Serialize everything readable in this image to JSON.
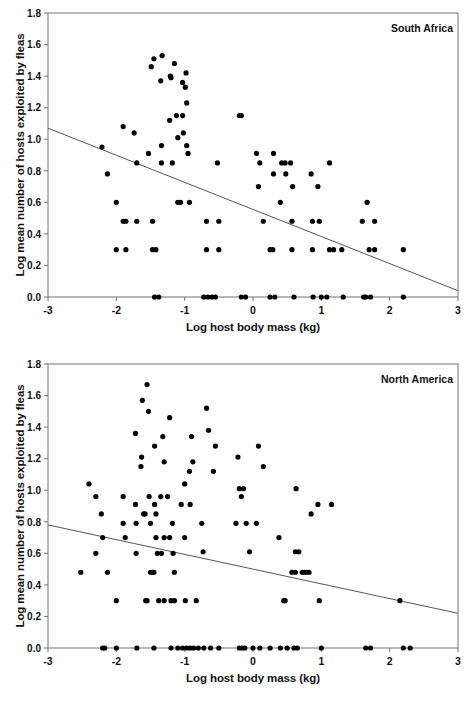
{
  "figure": {
    "background": "#ffffff",
    "point_color": "#000000",
    "axis_color": "#808080",
    "line_color": "#555555",
    "text_color": "#111111"
  },
  "chart_data": [
    {
      "type": "scatter",
      "panel_id": "south-africa",
      "title": "South Africa",
      "xlabel": "Log host body mass (kg)",
      "ylabel": "Log mean number of hosts exploited by fleas",
      "xlim": [
        -3,
        3
      ],
      "ylim": [
        0.0,
        1.8
      ],
      "xticks": [
        -3,
        -2,
        -1,
        0,
        1,
        2,
        3
      ],
      "xticklabels": [
        "-3",
        "-2",
        "-1",
        "0",
        "1",
        "2",
        "3"
      ],
      "yticks": [
        0.0,
        0.2,
        0.4,
        0.6,
        0.8,
        1.0,
        1.2,
        1.4,
        1.6,
        1.8
      ],
      "yticklabels": [
        "0.0",
        "0.2",
        "0.4",
        "0.6",
        "0.8",
        "1.0",
        "1.2",
        "1.4",
        "1.6",
        "1.8"
      ],
      "grid": false,
      "legend": "none",
      "marker": "filled-circle",
      "trendline": {
        "x": [
          -3,
          3
        ],
        "y": [
          1.07,
          0.04
        ]
      },
      "points": [
        [
          -2.21,
          0.95
        ],
        [
          -2.13,
          0.78
        ],
        [
          -2.0,
          0.6
        ],
        [
          -2.0,
          0.3
        ],
        [
          -1.9,
          1.08
        ],
        [
          -1.9,
          0.48
        ],
        [
          -1.86,
          0.48
        ],
        [
          -1.86,
          0.3
        ],
        [
          -1.74,
          1.04
        ],
        [
          -1.7,
          0.85
        ],
        [
          -1.7,
          0.48
        ],
        [
          -1.53,
          0.91
        ],
        [
          -1.49,
          1.46
        ],
        [
          -1.47,
          0.48
        ],
        [
          -1.47,
          0.3
        ],
        [
          -1.45,
          1.51
        ],
        [
          -1.42,
          0.3
        ],
        [
          -1.44,
          0.0
        ],
        [
          -1.38,
          0.0
        ],
        [
          -1.33,
          1.53
        ],
        [
          -1.35,
          1.37
        ],
        [
          -1.34,
          0.96
        ],
        [
          -1.34,
          0.85
        ],
        [
          -1.22,
          1.12
        ],
        [
          -1.2,
          1.39
        ],
        [
          -1.21,
          1.4
        ],
        [
          -1.18,
          0.85
        ],
        [
          -1.15,
          1.48
        ],
        [
          -1.12,
          1.15
        ],
        [
          -1.1,
          1.01
        ],
        [
          -1.1,
          0.6
        ],
        [
          -1.06,
          0.6
        ],
        [
          -1.03,
          1.36
        ],
        [
          -1.03,
          1.15
        ],
        [
          -1.02,
          1.04
        ],
        [
          -0.98,
          1.42
        ],
        [
          -0.99,
          1.33
        ],
        [
          -0.97,
          1.23
        ],
        [
          -0.97,
          0.96
        ],
        [
          -0.95,
          0.91
        ],
        [
          -0.93,
          0.6
        ],
        [
          -0.72,
          0.0
        ],
        [
          -0.68,
          0.48
        ],
        [
          -0.68,
          0.3
        ],
        [
          -0.66,
          0.0
        ],
        [
          -0.6,
          0.0
        ],
        [
          -0.55,
          0.0
        ],
        [
          -0.52,
          0.85
        ],
        [
          -0.5,
          0.48
        ],
        [
          -0.5,
          0.3
        ],
        [
          -0.2,
          1.15
        ],
        [
          -0.17,
          1.15
        ],
        [
          -0.17,
          0.0
        ],
        [
          -0.11,
          0.0
        ],
        [
          0.05,
          0.91
        ],
        [
          0.08,
          0.7
        ],
        [
          0.1,
          0.85
        ],
        [
          0.15,
          0.48
        ],
        [
          0.25,
          0.3
        ],
        [
          0.25,
          0.0
        ],
        [
          0.29,
          0.3
        ],
        [
          0.3,
          0.78
        ],
        [
          0.3,
          0.91
        ],
        [
          0.32,
          0.0
        ],
        [
          0.4,
          0.6
        ],
        [
          0.42,
          0.85
        ],
        [
          0.47,
          0.85
        ],
        [
          0.48,
          0.78
        ],
        [
          0.55,
          0.85
        ],
        [
          0.57,
          0.48
        ],
        [
          0.57,
          0.3
        ],
        [
          0.58,
          0.7
        ],
        [
          0.6,
          0.0
        ],
        [
          0.85,
          0.78
        ],
        [
          0.87,
          0.48
        ],
        [
          0.87,
          0.3
        ],
        [
          0.88,
          0.0
        ],
        [
          0.95,
          0.7
        ],
        [
          0.97,
          0.48
        ],
        [
          1.0,
          0.0
        ],
        [
          1.08,
          0.0
        ],
        [
          1.12,
          0.85
        ],
        [
          1.12,
          0.3
        ],
        [
          1.18,
          0.3
        ],
        [
          1.3,
          0.3
        ],
        [
          1.32,
          0.0
        ],
        [
          1.6,
          0.48
        ],
        [
          1.62,
          0.0
        ],
        [
          1.65,
          0.0
        ],
        [
          1.67,
          0.6
        ],
        [
          1.7,
          0.3
        ],
        [
          1.72,
          0.0
        ],
        [
          1.78,
          0.48
        ],
        [
          1.78,
          0.3
        ],
        [
          2.2,
          0.3
        ],
        [
          2.2,
          0.0
        ]
      ]
    },
    {
      "type": "scatter",
      "panel_id": "north-america",
      "title": "North America",
      "xlabel": "Log host body mass (kg)",
      "ylabel": "Log mean number of hosts exploited by fleas",
      "xlim": [
        -3,
        3
      ],
      "ylim": [
        0.0,
        1.8
      ],
      "xticks": [
        -3,
        -2,
        -1,
        0,
        1,
        2,
        3
      ],
      "xticklabels": [
        "-3",
        "-2",
        "-1",
        "0",
        "1",
        "2",
        "3"
      ],
      "yticks": [
        0.0,
        0.2,
        0.4,
        0.6,
        0.8,
        1.0,
        1.2,
        1.4,
        1.6,
        1.8
      ],
      "yticklabels": [
        "0.0",
        "0.2",
        "0.4",
        "0.6",
        "0.8",
        "1.0",
        "1.2",
        "1.4",
        "1.6",
        "1.8"
      ],
      "grid": false,
      "legend": "none",
      "marker": "filled-circle",
      "trendline": {
        "x": [
          -3,
          3
        ],
        "y": [
          0.78,
          0.22
        ]
      },
      "points": [
        [
          -2.52,
          0.48
        ],
        [
          -2.4,
          1.04
        ],
        [
          -2.3,
          0.96
        ],
        [
          -2.3,
          0.6
        ],
        [
          -2.22,
          0.85
        ],
        [
          -2.2,
          0.7
        ],
        [
          -2.2,
          0.0
        ],
        [
          -2.17,
          0.0
        ],
        [
          -2.13,
          0.48
        ],
        [
          -2.0,
          0.3
        ],
        [
          -2.0,
          0.0
        ],
        [
          -1.9,
          0.96
        ],
        [
          -1.9,
          0.79
        ],
        [
          -1.87,
          0.7
        ],
        [
          -1.72,
          1.36
        ],
        [
          -1.72,
          0.91
        ],
        [
          -1.71,
          0.79
        ],
        [
          -1.71,
          0.6
        ],
        [
          -1.7,
          0.0
        ],
        [
          -1.62,
          1.57
        ],
        [
          -1.63,
          1.21
        ],
        [
          -1.64,
          1.15
        ],
        [
          -1.6,
          0.85
        ],
        [
          -1.58,
          0.85
        ],
        [
          -1.57,
          0.3
        ],
        [
          -1.55,
          0.3
        ],
        [
          -1.55,
          1.67
        ],
        [
          -1.53,
          1.5
        ],
        [
          -1.52,
          0.96
        ],
        [
          -1.5,
          0.79
        ],
        [
          -1.5,
          0.48
        ],
        [
          -1.47,
          0.48
        ],
        [
          -1.45,
          0.48
        ],
        [
          -1.45,
          0.0
        ],
        [
          -1.44,
          1.28
        ],
        [
          -1.44,
          0.91
        ],
        [
          -1.42,
          0.85
        ],
        [
          -1.42,
          0.7
        ],
        [
          -1.4,
          0.6
        ],
        [
          -1.38,
          0.3
        ],
        [
          -1.35,
          0.96
        ],
        [
          -1.34,
          0.6
        ],
        [
          -1.32,
          1.34
        ],
        [
          -1.3,
          1.18
        ],
        [
          -1.3,
          0.7
        ],
        [
          -1.3,
          0.3
        ],
        [
          -1.25,
          0.96
        ],
        [
          -1.22,
          1.46
        ],
        [
          -1.22,
          0.7
        ],
        [
          -1.2,
          0.3
        ],
        [
          -1.2,
          0.0
        ],
        [
          -1.18,
          0.79
        ],
        [
          -1.17,
          0.6
        ],
        [
          -1.15,
          0.48
        ],
        [
          -1.15,
          0.3
        ],
        [
          -1.1,
          0.0
        ],
        [
          -1.05,
          0.91
        ],
        [
          -1.03,
          0.0
        ],
        [
          -1.0,
          1.04
        ],
        [
          -1.0,
          0.7
        ],
        [
          -0.99,
          0.3
        ],
        [
          -0.97,
          0.0
        ],
        [
          -0.93,
          1.12
        ],
        [
          -0.92,
          0.91
        ],
        [
          -0.92,
          0.0
        ],
        [
          -0.9,
          1.34
        ],
        [
          -0.88,
          1.18
        ],
        [
          -0.87,
          0.0
        ],
        [
          -0.83,
          0.3
        ],
        [
          -0.8,
          0.0
        ],
        [
          -0.75,
          0.79
        ],
        [
          -0.73,
          0.61
        ],
        [
          -0.72,
          0.0
        ],
        [
          -0.68,
          1.52
        ],
        [
          -0.65,
          1.38
        ],
        [
          -0.62,
          0.0
        ],
        [
          -0.58,
          1.12
        ],
        [
          -0.55,
          1.28
        ],
        [
          -0.5,
          0.0
        ],
        [
          -0.25,
          0.79
        ],
        [
          -0.22,
          1.21
        ],
        [
          -0.2,
          1.01
        ],
        [
          -0.2,
          0.0
        ],
        [
          -0.17,
          0.96
        ],
        [
          -0.16,
          0.0
        ],
        [
          -0.14,
          1.01
        ],
        [
          -0.12,
          0.0
        ],
        [
          -0.1,
          0.79
        ],
        [
          -0.05,
          0.61
        ],
        [
          0.0,
          0.0
        ],
        [
          0.05,
          0.79
        ],
        [
          0.08,
          1.28
        ],
        [
          0.1,
          0.0
        ],
        [
          0.15,
          1.15
        ],
        [
          0.25,
          0.0
        ],
        [
          0.38,
          0.7
        ],
        [
          0.4,
          0.0
        ],
        [
          0.45,
          0.3
        ],
        [
          0.47,
          0.3
        ],
        [
          0.5,
          0.0
        ],
        [
          0.57,
          0.48
        ],
        [
          0.6,
          0.0
        ],
        [
          0.62,
          0.48
        ],
        [
          0.62,
          0.61
        ],
        [
          0.63,
          1.01
        ],
        [
          0.65,
          0.0
        ],
        [
          0.67,
          0.61
        ],
        [
          0.72,
          0.48
        ],
        [
          0.75,
          0.48
        ],
        [
          0.78,
          0.48
        ],
        [
          0.82,
          0.48
        ],
        [
          0.85,
          0.85
        ],
        [
          0.95,
          0.91
        ],
        [
          0.97,
          0.3
        ],
        [
          1.0,
          0.0
        ],
        [
          1.15,
          0.91
        ],
        [
          1.65,
          0.0
        ],
        [
          1.72,
          0.0
        ],
        [
          2.15,
          0.3
        ],
        [
          2.2,
          0.0
        ],
        [
          2.3,
          0.0
        ]
      ]
    }
  ]
}
